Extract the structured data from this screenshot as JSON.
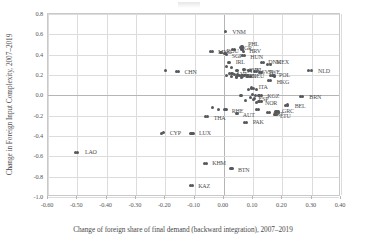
{
  "chart_data": {
    "type": "scatter",
    "title": "",
    "xlabel": "Change of foreign share of final demand (backward integration), 2007–2019",
    "ylabel": "Change in Foreign Input Complexity, 2007–2019",
    "xlim": [
      -0.6,
      0.4
    ],
    "ylim": [
      -1.0,
      0.8
    ],
    "xticks": [
      "-0.60",
      "-0.50",
      "-0.40",
      "-0.30",
      "-0.20",
      "-0.10",
      "0.00",
      "0.10",
      "0.20",
      "0.30",
      "0.40"
    ],
    "xtick_values": [
      -0.6,
      -0.5,
      -0.4,
      -0.3,
      -0.2,
      -0.1,
      0.0,
      0.1,
      0.2,
      0.3,
      0.4
    ],
    "yticks": [
      "0.8",
      "0.6",
      "0.4",
      "0.2",
      "0.0",
      "-0.2",
      "-0.4",
      "-0.6",
      "-0.8",
      "-1.0"
    ],
    "ytick_values": [
      0.8,
      0.6,
      0.4,
      0.2,
      0.0,
      -0.2,
      -0.4,
      -0.6,
      -0.8,
      -1.0
    ],
    "grid": true,
    "legend": "none",
    "marker_color": "#55585c",
    "points": [
      {
        "label": "VNM",
        "x": 0.005,
        "y": 0.625,
        "lx": 7,
        "ly": 0
      },
      {
        "label": "BGR",
        "x": 0.035,
        "y": 0.455,
        "lx": 6,
        "ly": -1
      },
      {
        "label": "PHL",
        "x": 0.062,
        "y": 0.475,
        "lx": 6,
        "ly": -3
      },
      {
        "label": "HRV",
        "x": 0.066,
        "y": 0.435,
        "lx": 6,
        "ly": 0
      },
      {
        "label": "MNG",
        "x": -0.04,
        "y": 0.43,
        "lx": 6,
        "ly": 0
      },
      {
        "label": "ROU",
        "x": -0.008,
        "y": 0.425,
        "lx": 5,
        "ly": -1
      },
      {
        "label": "SGP",
        "x": 0.01,
        "y": 0.405,
        "lx": 5,
        "ly": 2
      },
      {
        "label": "HUN",
        "x": 0.07,
        "y": 0.39,
        "lx": 6,
        "ly": 1
      },
      {
        "label": "IRL",
        "x": 0.02,
        "y": 0.325,
        "lx": 6,
        "ly": 0
      },
      {
        "label": "DNK",
        "x": 0.135,
        "y": 0.32,
        "lx": 5,
        "ly": -1
      },
      {
        "label": "MEX",
        "x": 0.158,
        "y": 0.305,
        "lx": 6,
        "ly": -2
      },
      {
        "label": "CHN",
        "x": -0.155,
        "y": 0.235,
        "lx": 6,
        "ly": 1
      },
      {
        "label": "EST",
        "x": 0.048,
        "y": 0.245,
        "lx": 5,
        "ly": 1
      },
      {
        "label": "SVK",
        "x": 0.072,
        "y": 0.25,
        "lx": 4,
        "ly": 0
      },
      {
        "label": "ISL",
        "x": 0.09,
        "y": 0.245,
        "lx": 4,
        "ly": 0
      },
      {
        "label": "SVN",
        "x": 0.112,
        "y": 0.235,
        "lx": 5,
        "ly": 1
      },
      {
        "label": "SWE",
        "x": 0.13,
        "y": 0.225,
        "lx": 6,
        "ly": 0
      },
      {
        "label": "LVA",
        "x": 0.028,
        "y": 0.215,
        "lx": 5,
        "ly": 1
      },
      {
        "label": "TUR",
        "x": 0.046,
        "y": 0.2,
        "lx": 4,
        "ly": 1
      },
      {
        "label": "IDN",
        "x": 0.062,
        "y": 0.195,
        "lx": 4,
        "ly": 0
      },
      {
        "label": "DEU",
        "x": 0.08,
        "y": 0.19,
        "lx": 5,
        "ly": 0
      },
      {
        "label": "POL",
        "x": 0.168,
        "y": 0.195,
        "lx": 6,
        "ly": -1
      },
      {
        "label": "HKG",
        "x": 0.16,
        "y": 0.145,
        "lx": 6,
        "ly": 1
      },
      {
        "label": "NLD",
        "x": 0.298,
        "y": 0.24,
        "lx": 7,
        "ly": 0
      },
      {
        "label": "ITA",
        "x": 0.102,
        "y": 0.07,
        "lx": 5,
        "ly": -1
      },
      {
        "label": "DNK2",
        "x": 0.06,
        "y": 0.0,
        "lx": 0,
        "ly": 0
      },
      {
        "label": "KGZ",
        "x": 0.128,
        "y": 0.0,
        "lx": 6,
        "ly": 1
      },
      {
        "label": "ESP",
        "x": 0.105,
        "y": -0.035,
        "lx": 4,
        "ly": 0
      },
      {
        "label": "NOR",
        "x": 0.12,
        "y": -0.065,
        "lx": 6,
        "ly": 1
      },
      {
        "label": "BRN",
        "x": 0.268,
        "y": -0.012,
        "lx": 7,
        "ly": 0
      },
      {
        "label": "BEL",
        "x": 0.218,
        "y": -0.095,
        "lx": 7,
        "ly": 1
      },
      {
        "label": "HRV2",
        "x": 0.118,
        "y": -0.135,
        "lx": 5,
        "ly": 0
      },
      {
        "label": "RHE",
        "x": 0.01,
        "y": -0.14,
        "lx": 5,
        "ly": 1
      },
      {
        "label": "AUT",
        "x": 0.048,
        "y": -0.175,
        "lx": 5,
        "ly": 2
      },
      {
        "label": "PRT",
        "x": 0.155,
        "y": -0.17,
        "lx": 4,
        "ly": 1
      },
      {
        "label": "GRC",
        "x": 0.185,
        "y": -0.155,
        "lx": 4,
        "ly": 0
      },
      {
        "label": "LTU",
        "x": 0.178,
        "y": -0.185,
        "lx": 4,
        "ly": 2
      },
      {
        "label": "THA",
        "x": -0.055,
        "y": -0.205,
        "lx": 6,
        "ly": 2
      },
      {
        "label": "PAK",
        "x": 0.078,
        "y": -0.265,
        "lx": 6,
        "ly": 0
      },
      {
        "label": "CYP",
        "x": -0.205,
        "y": -0.37,
        "lx": 6,
        "ly": 0
      },
      {
        "label": "LUX",
        "x": -0.105,
        "y": -0.375,
        "lx": 6,
        "ly": 0
      },
      {
        "label": "LAO",
        "x": -0.498,
        "y": -0.56,
        "lx": 7,
        "ly": 0
      },
      {
        "label": "KHM",
        "x": -0.06,
        "y": -0.67,
        "lx": 6,
        "ly": 0
      },
      {
        "label": "BTN",
        "x": 0.028,
        "y": -0.722,
        "lx": 6,
        "ly": 1
      },
      {
        "label": "KAZ",
        "x": -0.108,
        "y": -0.885,
        "lx": 6,
        "ly": 1
      }
    ],
    "unlabeled_points": [
      {
        "x": 0.03,
        "y": 0.455
      },
      {
        "x": 0.058,
        "y": 0.47
      },
      {
        "x": 0.062,
        "y": 0.455
      },
      {
        "x": -0.045,
        "y": 0.43
      },
      {
        "x": -0.012,
        "y": 0.425
      },
      {
        "x": 0.004,
        "y": 0.408
      },
      {
        "x": 0.065,
        "y": 0.388
      },
      {
        "x": 0.016,
        "y": 0.325
      },
      {
        "x": 0.13,
        "y": 0.32
      },
      {
        "x": 0.15,
        "y": 0.305
      },
      {
        "x": 0.01,
        "y": 0.28
      },
      {
        "x": 0.026,
        "y": 0.27
      },
      {
        "x": -0.2,
        "y": 0.24
      },
      {
        "x": -0.162,
        "y": 0.235
      },
      {
        "x": 0.042,
        "y": 0.245
      },
      {
        "x": 0.066,
        "y": 0.25
      },
      {
        "x": 0.085,
        "y": 0.248
      },
      {
        "x": 0.104,
        "y": 0.238
      },
      {
        "x": 0.122,
        "y": 0.228
      },
      {
        "x": 0.02,
        "y": 0.215
      },
      {
        "x": 0.038,
        "y": 0.205
      },
      {
        "x": 0.055,
        "y": 0.198
      },
      {
        "x": 0.072,
        "y": 0.192
      },
      {
        "x": 0.16,
        "y": 0.198
      },
      {
        "x": 0.172,
        "y": 0.19
      },
      {
        "x": 0.01,
        "y": 0.195
      },
      {
        "x": 0.026,
        "y": 0.185
      },
      {
        "x": 0.044,
        "y": 0.18
      },
      {
        "x": 0.06,
        "y": 0.178
      },
      {
        "x": 0.09,
        "y": 0.185
      },
      {
        "x": 0.152,
        "y": 0.15
      },
      {
        "x": 0.29,
        "y": 0.24
      },
      {
        "x": 0.095,
        "y": 0.072
      },
      {
        "x": 0.085,
        "y": 0.055
      },
      {
        "x": 0.112,
        "y": 0.06
      },
      {
        "x": 0.058,
        "y": 0.002
      },
      {
        "x": 0.098,
        "y": 0.012
      },
      {
        "x": 0.108,
        "y": 0.0
      },
      {
        "x": 0.12,
        "y": -0.002
      },
      {
        "x": 0.09,
        "y": -0.02
      },
      {
        "x": 0.1,
        "y": -0.038
      },
      {
        "x": 0.075,
        "y": -0.055
      },
      {
        "x": 0.112,
        "y": -0.068
      },
      {
        "x": 0.13,
        "y": -0.062
      },
      {
        "x": 0.262,
        "y": -0.012
      },
      {
        "x": 0.21,
        "y": -0.098
      },
      {
        "x": 0.112,
        "y": -0.138
      },
      {
        "x": -0.038,
        "y": -0.12
      },
      {
        "x": -0.018,
        "y": -0.142
      },
      {
        "x": 0.004,
        "y": -0.14
      },
      {
        "x": 0.042,
        "y": -0.178
      },
      {
        "x": 0.148,
        "y": -0.172
      },
      {
        "x": 0.178,
        "y": -0.158
      },
      {
        "x": 0.172,
        "y": -0.188
      },
      {
        "x": 0.186,
        "y": -0.172
      },
      {
        "x": -0.062,
        "y": -0.208
      },
      {
        "x": 0.072,
        "y": -0.268
      },
      {
        "x": -0.212,
        "y": -0.372
      },
      {
        "x": -0.112,
        "y": -0.376
      },
      {
        "x": -0.505,
        "y": -0.562
      },
      {
        "x": -0.066,
        "y": -0.672
      },
      {
        "x": 0.022,
        "y": -0.724
      },
      {
        "x": -0.115,
        "y": -0.888
      }
    ]
  }
}
